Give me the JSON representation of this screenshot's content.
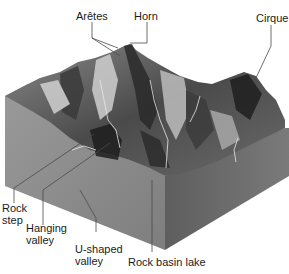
{
  "diagram": {
    "type": "block-diagram",
    "labels": {
      "aretes": "Arêtes",
      "horn": "Horn",
      "cirque": "Cirque",
      "rock_step": "Rock\nstep",
      "hanging_valley": "Hanging\nvalley",
      "u_shaped_valley": "U-shaped\nvalley",
      "rock_basin_lake": "Rock basin lake"
    },
    "colors": {
      "background": "#ffffff",
      "left_face": "#8c8c8c",
      "right_face": "#6e6e6e",
      "terrain_dark": "#2a2a2a",
      "terrain_mid": "#6a6a6a",
      "terrain_light": "#c8c8c8",
      "leader_lines": "#4a4a4a",
      "text": "#1a1a1a"
    }
  }
}
